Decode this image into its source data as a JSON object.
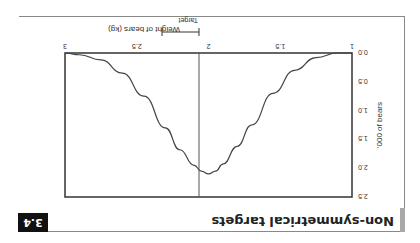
{
  "figure": {
    "badge": "3.4",
    "title": "Non-symmetrical targets"
  },
  "chart_data": {
    "type": "line",
    "title": "Non-symmetrical targets",
    "xlabel": "Weight of bears (kg)",
    "ylabel": "'000 of bears",
    "xlim": [
      1,
      3
    ],
    "ylim": [
      0,
      2.5
    ],
    "xticks": [
      "1",
      "1.5",
      "2",
      "2.5",
      "3"
    ],
    "yticks": [
      "0.0",
      "0.5",
      "1.0",
      "1.5",
      "2.0",
      "2.5"
    ],
    "grid": false,
    "annotations": [
      {
        "text": "Target",
        "x": 2,
        "arrow_from": 2,
        "arrow_to": 2.37,
        "vertical_line_at": 2
      }
    ],
    "series": [
      {
        "name": "distribution",
        "x": [
          1.1,
          1.25,
          1.4,
          1.55,
          1.7,
          1.8,
          1.9,
          1.95,
          2.0,
          2.05,
          2.1,
          2.2,
          2.3,
          2.45,
          2.6,
          2.75,
          2.9,
          3.0
        ],
        "y": [
          0.0,
          0.08,
          0.3,
          0.7,
          1.25,
          1.62,
          1.93,
          2.05,
          2.1,
          2.05,
          1.95,
          1.68,
          1.3,
          0.75,
          0.35,
          0.12,
          0.03,
          0.0
        ]
      }
    ]
  }
}
